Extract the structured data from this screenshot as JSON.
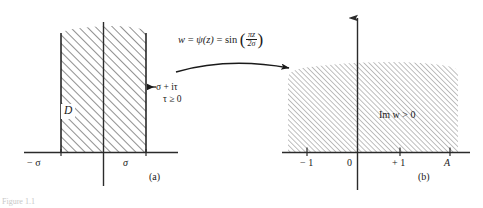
{
  "figure": {
    "caption_fragment": "Figure 1.1",
    "panels": [
      {
        "id": "a",
        "caption": "(a)",
        "domain_label": "D",
        "description": "semi-infinite vertical strip -sigma < Re z < sigma, Im z >= 0"
      },
      {
        "id": "b",
        "caption": "(b)",
        "region_label": "Im w > 0",
        "description": "upper half w-plane"
      }
    ]
  },
  "transform": {
    "lhs": "w",
    "eq1": "=",
    "psi": "ψ(z)",
    "eq2": "=",
    "fn": "sin",
    "numerator": "πz",
    "denominator": "2σ",
    "paren_open": "(",
    "paren_close": ")",
    "full": "w = ψ(z) = sin(πz/2σ)",
    "arrow": "curved-right-arrow"
  },
  "panel_a": {
    "domain_label": "D",
    "axis_ticks": [
      {
        "name": "left-edge",
        "label": "− σ",
        "value": -1
      },
      {
        "name": "right-edge",
        "label": "σ",
        "value": 1
      }
    ],
    "boundary_note_line1": "σ + iτ",
    "boundary_note_line2": "τ ≥ 0",
    "pointer": "left-arrow",
    "caption": "(a)"
  },
  "panel_b": {
    "region_label": "Im w > 0",
    "axis_ticks": [
      {
        "name": "tick-minus-one",
        "label": "− 1",
        "value": -1
      },
      {
        "name": "tick-zero",
        "label": "0",
        "value": 0
      },
      {
        "name": "tick-plus-one",
        "label": "+ 1",
        "value": 1
      },
      {
        "name": "tick-A",
        "label": "A",
        "value": 2
      }
    ],
    "caption": "(b)",
    "vertical_axis": "imaginary-axis-up-arrow"
  },
  "colors": {
    "ink": "#1a1a1a",
    "hatch": "#5a5a5a",
    "axis": "#2b2b2b",
    "page": "#ffffff"
  }
}
